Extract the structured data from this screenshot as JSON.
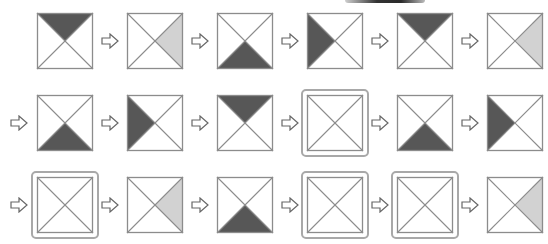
{
  "colors": {
    "dark": "#575757",
    "light": "#d2d2d2",
    "line": "#8c8c8c",
    "frame": "#a8a8a8"
  },
  "rows": [
    {
      "leading_arrow": false,
      "cells": [
        {
          "shaded": "top",
          "tone": "dark",
          "framed": false
        },
        {
          "shaded": "right",
          "tone": "light",
          "framed": false
        },
        {
          "shaded": "bottom",
          "tone": "dark",
          "framed": false
        },
        {
          "shaded": "left",
          "tone": "dark",
          "framed": false
        },
        {
          "shaded": "top",
          "tone": "dark",
          "framed": false
        },
        {
          "shaded": "right",
          "tone": "light",
          "framed": false
        }
      ]
    },
    {
      "leading_arrow": true,
      "cells": [
        {
          "shaded": "bottom",
          "tone": "dark",
          "framed": false
        },
        {
          "shaded": "left",
          "tone": "dark",
          "framed": false
        },
        {
          "shaded": "top",
          "tone": "dark",
          "framed": false
        },
        {
          "shaded": "none",
          "tone": "none",
          "framed": true
        },
        {
          "shaded": "bottom",
          "tone": "dark",
          "framed": false
        },
        {
          "shaded": "left",
          "tone": "dark",
          "framed": false
        }
      ]
    },
    {
      "leading_arrow": true,
      "cells": [
        {
          "shaded": "none",
          "tone": "none",
          "framed": true
        },
        {
          "shaded": "right",
          "tone": "light",
          "framed": false
        },
        {
          "shaded": "bottom",
          "tone": "dark",
          "framed": false
        },
        {
          "shaded": "none",
          "tone": "none",
          "framed": true
        },
        {
          "shaded": "none",
          "tone": "none",
          "framed": true
        },
        {
          "shaded": "right",
          "tone": "light",
          "framed": false
        }
      ]
    }
  ],
  "arrow_glyph": "right-arrow"
}
